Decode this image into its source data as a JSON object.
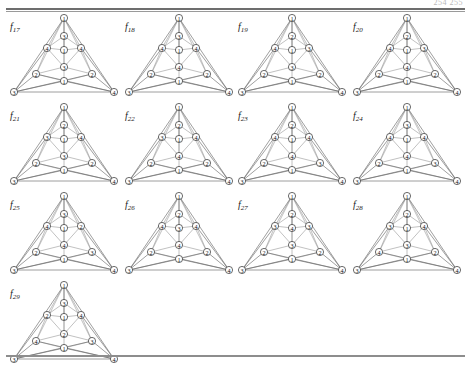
{
  "page": {
    "folio": "254 255",
    "figure_count": 13,
    "rule_color": "#6d6d6d",
    "node_stroke": "#2b2b2b",
    "edge_color": "#8e8e8e",
    "background": "#ffffff"
  },
  "layout": {
    "columns": 4,
    "rows": 4,
    "cell_width": 116,
    "cell_height": 88,
    "node_positions": {
      "apex": [
        58,
        6
      ],
      "c1": [
        58,
        24
      ],
      "l2": [
        41,
        36
      ],
      "c2": [
        58,
        38
      ],
      "r2": [
        75,
        36
      ],
      "c3": [
        58,
        55
      ],
      "l4": [
        30,
        62
      ],
      "c4": [
        58,
        69
      ],
      "r4": [
        86,
        62
      ],
      "bl": [
        8,
        80
      ],
      "br": [
        108,
        80
      ]
    }
  },
  "figures": [
    {
      "id": "f17",
      "caption_prefix": "f",
      "caption_sub": "17",
      "nodes": {
        "apex": "1",
        "c1": "3",
        "l2": "4",
        "c2": "1",
        "r2": "4",
        "c3": "3",
        "l4": "2",
        "c4": "1",
        "r4": "2",
        "bl": "3",
        "br": "4"
      }
    },
    {
      "id": "f18",
      "caption_prefix": "f",
      "caption_sub": "18",
      "nodes": {
        "apex": "1",
        "c1": "3",
        "l2": "4",
        "c2": "1",
        "r2": "4",
        "c3": "4",
        "l4": "2",
        "c4": "1",
        "r4": "2",
        "bl": "3",
        "br": "4"
      }
    },
    {
      "id": "f19",
      "caption_prefix": "f",
      "caption_sub": "19",
      "nodes": {
        "apex": "1",
        "c1": "2",
        "l2": "4",
        "c2": "1",
        "r2": "3",
        "c3": "3",
        "l4": "2",
        "c4": "1",
        "r4": "2",
        "bl": "3",
        "br": "4"
      }
    },
    {
      "id": "f20",
      "caption_prefix": "f",
      "caption_sub": "20",
      "nodes": {
        "apex": "1",
        "c1": "2",
        "l2": "4",
        "c2": "1",
        "r2": "3",
        "c3": "4",
        "l4": "2",
        "c4": "1",
        "r4": "2",
        "bl": "3",
        "br": "4"
      }
    },
    {
      "id": "f21",
      "caption_prefix": "f",
      "caption_sub": "21",
      "nodes": {
        "apex": "1",
        "c1": "2",
        "l2": "3",
        "c2": "1",
        "r2": "4",
        "c3": "3",
        "l4": "2",
        "c4": "1",
        "r4": "2",
        "bl": "3",
        "br": "4"
      }
    },
    {
      "id": "f22",
      "caption_prefix": "f",
      "caption_sub": "22",
      "nodes": {
        "apex": "1",
        "c1": "2",
        "l2": "3",
        "c2": "1",
        "r2": "4",
        "c3": "4",
        "l4": "2",
        "c4": "1",
        "r4": "2",
        "bl": "3",
        "br": "4"
      }
    },
    {
      "id": "f23",
      "caption_prefix": "f",
      "caption_sub": "23",
      "nodes": {
        "apex": "1",
        "c1": "2",
        "l2": "4",
        "c2": "1",
        "r2": "4",
        "c3": "4",
        "l4": "2",
        "c4": "1",
        "r4": "3",
        "bl": "3",
        "br": "4"
      }
    },
    {
      "id": "f24",
      "caption_prefix": "f",
      "caption_sub": "24",
      "nodes": {
        "apex": "1",
        "c1": "3",
        "l2": "4",
        "c2": "1",
        "r2": "4",
        "c3": "4",
        "l4": "2",
        "c4": "1",
        "r4": "3",
        "bl": "3",
        "br": "4"
      }
    },
    {
      "id": "f25",
      "caption_prefix": "f",
      "caption_sub": "25",
      "nodes": {
        "apex": "1",
        "c1": "3",
        "l2": "4",
        "c2": "1",
        "r2": "2",
        "c3": "4",
        "l4": "2",
        "c4": "1",
        "r4": "3",
        "bl": "3",
        "br": "4"
      }
    },
    {
      "id": "f26",
      "caption_prefix": "f",
      "caption_sub": "26",
      "nodes": {
        "apex": "1",
        "c1": "2",
        "l2": "4",
        "c2": "3",
        "r2": "4",
        "c3": "4",
        "l4": "2",
        "c4": "1",
        "r4": "2",
        "bl": "3",
        "br": "4"
      }
    },
    {
      "id": "f27",
      "caption_prefix": "f",
      "caption_sub": "27",
      "nodes": {
        "apex": "1",
        "c1": "2",
        "l2": "3",
        "c2": "4",
        "r2": "3",
        "c3": "3",
        "l4": "2",
        "c4": "1",
        "r4": "2",
        "bl": "3",
        "br": "4"
      }
    },
    {
      "id": "f28",
      "caption_prefix": "f",
      "caption_sub": "28",
      "nodes": {
        "apex": "1",
        "c1": "2",
        "l2": "3",
        "c2": "1",
        "r2": "4",
        "c3": "3",
        "l4": "4",
        "c4": "1",
        "r4": "2",
        "bl": "3",
        "br": "4"
      }
    },
    {
      "id": "f29",
      "caption_prefix": "f",
      "caption_sub": "29",
      "nodes": {
        "apex": "1",
        "c1": "3",
        "l2": "2",
        "c2": "1",
        "r2": "4",
        "c3": "2",
        "l4": "4",
        "c4": "1",
        "r4": "3",
        "bl": "3",
        "br": "4"
      }
    }
  ]
}
